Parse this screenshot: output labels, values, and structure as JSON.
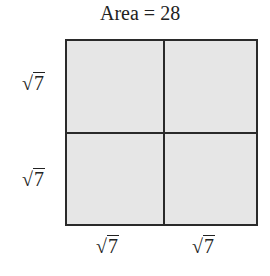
{
  "title": "Area = 28",
  "labels": {
    "left_top": "7",
    "left_bottom": "7",
    "bottom_left": "7",
    "bottom_right": "7"
  },
  "radical_symbol": "√",
  "colors": {
    "fill": "#e6e6e6",
    "stroke": "#2a2a2a"
  }
}
